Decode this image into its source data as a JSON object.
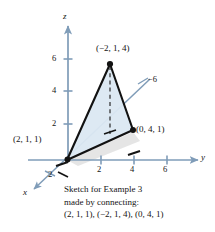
{
  "figure": {
    "colors": {
      "axis": "#7f9cb8",
      "triangle_fill": "#dbe8f2",
      "triangle_edge": "#121212",
      "shadow": "#d8d8d8",
      "text": "#141414",
      "background": "#ffffff"
    },
    "axes": [
      {
        "name": "z",
        "label": "z",
        "direction": "up"
      },
      {
        "name": "y",
        "label": "y",
        "direction": "right"
      },
      {
        "name": "x",
        "label": "x",
        "direction": "down-left"
      }
    ],
    "ticks": {
      "z": [
        "2",
        "4",
        "6"
      ],
      "y": [
        "2",
        "4",
        "6"
      ],
      "x": [
        "2"
      ],
      "x_negative": [
        "−6"
      ]
    },
    "points": [
      {
        "label": "(2, 1, 1)",
        "x": 2,
        "y": 1,
        "z": 1
      },
      {
        "label": "(−2, 1, 4)",
        "x": -2,
        "y": 1,
        "z": 4
      },
      {
        "label": "(0, 4, 1)",
        "x": 0,
        "y": 4,
        "z": 1
      }
    ]
  },
  "caption": {
    "line1": "Sketch for Example 3",
    "line2": "made by connecting:",
    "line3": "(2, 1, 1), (−2, 1, 4), (0, 4, 1)"
  }
}
